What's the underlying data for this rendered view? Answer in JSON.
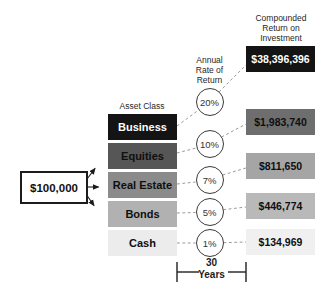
{
  "headers": {
    "asset_class": "Asset Class",
    "annual_rate": "Annual\nRate of\nReturn",
    "compounded_return": "Compounded\nReturn on\nInvestment"
  },
  "principal": {
    "amount": "$100,000"
  },
  "rows": [
    {
      "asset": "Business",
      "rate": "20%",
      "return": "$38,396,396",
      "asset_bg": "#141414",
      "asset_fg": "#ffffff",
      "return_bg": "#141414",
      "return_fg": "#ffffff"
    },
    {
      "asset": "Equities",
      "rate": "10%",
      "return": "$1,983,740",
      "asset_bg": "#565656",
      "asset_fg": "#0f0f0f",
      "return_bg": "#6e6e6e",
      "return_fg": "#0f0f0f"
    },
    {
      "asset": "Real Estate",
      "rate": "7%",
      "return": "$811,650",
      "asset_bg": "#8b8b8b",
      "asset_fg": "#0f0f0f",
      "return_bg": "#a5a5a5",
      "return_fg": "#0f0f0f"
    },
    {
      "asset": "Bonds",
      "rate": "5%",
      "return": "$446,774",
      "asset_bg": "#b1b1b1",
      "asset_fg": "#0f0f0f",
      "return_bg": "#b9b9b9",
      "return_fg": "#0f0f0f"
    },
    {
      "asset": "Cash",
      "rate": "1%",
      "return": "$134,969",
      "asset_bg": "#ececec",
      "asset_fg": "#0f0f0f",
      "return_bg": "#f0f0f0",
      "return_fg": "#0f0f0f"
    }
  ],
  "timeline": {
    "duration": "30",
    "unit": "Years"
  },
  "colors": {
    "connector": "#999999",
    "arrow": "#1a1a1a",
    "bracket": "#2e2e2e"
  }
}
